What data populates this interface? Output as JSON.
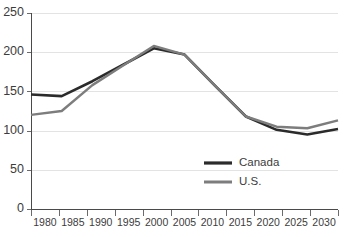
{
  "chart_data": {
    "type": "line",
    "title": "",
    "subtitle": "",
    "xlabel": "",
    "ylabel": "",
    "x": [
      1980,
      1985,
      1990,
      1995,
      2000,
      2005,
      2010,
      2015,
      2020,
      2025,
      2030
    ],
    "categories": [
      "1980",
      "1985",
      "1990",
      "1995",
      "2000",
      "2005",
      "2010",
      "2015",
      "2020",
      "2025",
      "2030"
    ],
    "series": [
      {
        "name": "Canada",
        "color": "#2b2b2b",
        "width": 2.6,
        "values": [
          146,
          144,
          163,
          184,
          205,
          197,
          157,
          118,
          101,
          95,
          102
        ]
      },
      {
        "name": "U.S.",
        "color": "#7d7d7d",
        "width": 2.4,
        "values": [
          120,
          125,
          158,
          183,
          208,
          197,
          157,
          118,
          105,
          103,
          113
        ]
      }
    ],
    "xlim": [
      1980,
      2030
    ],
    "ylim": [
      0,
      250
    ],
    "yticks": [
      0,
      50,
      100,
      150,
      200,
      250
    ],
    "ytick_labels": [
      "0",
      "50",
      "100",
      "150",
      "200",
      "250"
    ],
    "xticks": [
      1980,
      1985,
      1990,
      1995,
      2000,
      2005,
      2010,
      2015,
      2020,
      2025,
      2030
    ],
    "grid": true,
    "grid_axis": "y",
    "grid_color": "#e3e3e3",
    "legend": {
      "position": "inside-lower-center",
      "entries": [
        {
          "label": "Canada",
          "color": "#2b2b2b",
          "width": 2.6
        },
        {
          "label": "U.S.",
          "color": "#7d7d7d",
          "width": 2.4
        }
      ]
    },
    "background_color": "#ffffff",
    "axis_color": "#4a4a4a",
    "tick_label_color": "#3c3c3c"
  },
  "layout": {
    "plot_left": 31,
    "plot_right": 338,
    "plot_top": 13,
    "plot_bottom": 209,
    "legend_x_swatch_start": 204,
    "legend_x_swatch_end": 232,
    "legend_x_text": 239,
    "legend_y_canada": 163,
    "legend_y_us": 182
  }
}
